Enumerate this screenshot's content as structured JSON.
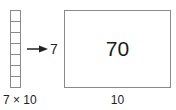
{
  "column": {
    "cells": 7,
    "caption": "7 × 10"
  },
  "arrow": {
    "label": "7",
    "icon": "right-arrow-icon"
  },
  "rectangle": {
    "value": "70",
    "caption": "10"
  },
  "colors": {
    "stroke": "#8a8a8a",
    "text": "#222222"
  }
}
